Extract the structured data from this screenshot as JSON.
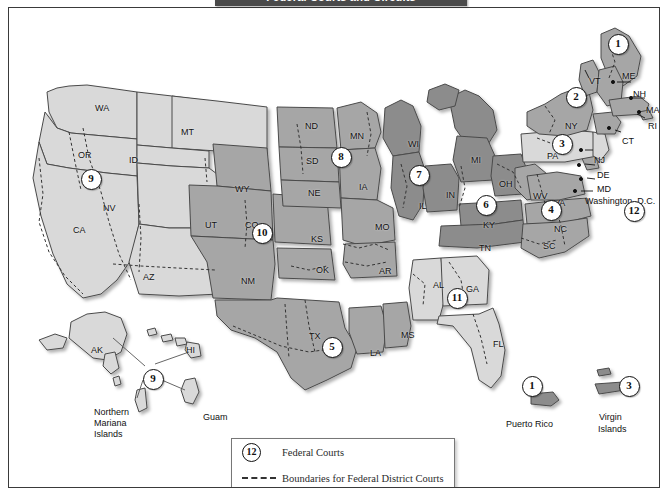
{
  "title": "Federal Courts and Circuits",
  "legend": {
    "courts_symbol": "12",
    "courts_label": "Federal Courts",
    "boundaries_label": "Boundaries for Federal District Courts"
  },
  "circuits": [
    {
      "id": "1",
      "x": 608,
      "y": 35,
      "name": "circuit-1"
    },
    {
      "id": "2",
      "x": 566,
      "y": 88,
      "name": "circuit-2"
    },
    {
      "id": "3",
      "x": 552,
      "y": 135,
      "name": "circuit-3"
    },
    {
      "id": "4",
      "x": 541,
      "y": 201,
      "name": "circuit-4"
    },
    {
      "id": "5",
      "x": 322,
      "y": 338,
      "name": "circuit-5"
    },
    {
      "id": "6",
      "x": 476,
      "y": 196,
      "name": "circuit-6"
    },
    {
      "id": "7",
      "x": 409,
      "y": 166,
      "name": "circuit-7"
    },
    {
      "id": "8",
      "x": 331,
      "y": 148,
      "name": "circuit-8"
    },
    {
      "id": "9",
      "x": 81,
      "y": 170,
      "name": "circuit-9-mainland"
    },
    {
      "id": "10",
      "x": 252,
      "y": 224,
      "name": "circuit-10"
    },
    {
      "id": "11",
      "x": 447,
      "y": 289,
      "name": "circuit-11"
    },
    {
      "id": "12",
      "x": 624,
      "y": 202,
      "name": "circuit-12-dc"
    },
    {
      "id": "9",
      "x": 143,
      "y": 370,
      "name": "circuit-9-pacific"
    },
    {
      "id": "1",
      "x": 522,
      "y": 377,
      "name": "circuit-1-puerto-rico"
    },
    {
      "id": "3",
      "x": 619,
      "y": 377,
      "name": "circuit-3-virgin-islands"
    }
  ],
  "state_labels": [
    {
      "t": "WA",
      "x": 86,
      "y": 95
    },
    {
      "t": "OR",
      "x": 69,
      "y": 142
    },
    {
      "t": "ID",
      "x": 120,
      "y": 147
    },
    {
      "t": "MT",
      "x": 172,
      "y": 119
    },
    {
      "t": "NV",
      "x": 94,
      "y": 195
    },
    {
      "t": "CA",
      "x": 64,
      "y": 217
    },
    {
      "t": "AZ",
      "x": 134,
      "y": 264
    },
    {
      "t": "UT",
      "x": 196,
      "y": 212
    },
    {
      "t": "CO",
      "x": 236,
      "y": 212
    },
    {
      "t": "WY",
      "x": 226,
      "y": 176
    },
    {
      "t": "NM",
      "x": 232,
      "y": 268
    },
    {
      "t": "ND",
      "x": 296,
      "y": 113
    },
    {
      "t": "SD",
      "x": 297,
      "y": 148
    },
    {
      "t": "NE",
      "x": 299,
      "y": 180
    },
    {
      "t": "KS",
      "x": 302,
      "y": 226
    },
    {
      "t": "OK",
      "x": 307,
      "y": 257
    },
    {
      "t": "TX",
      "x": 300,
      "y": 323
    },
    {
      "t": "MN",
      "x": 341,
      "y": 123
    },
    {
      "t": "IA",
      "x": 350,
      "y": 174
    },
    {
      "t": "MO",
      "x": 366,
      "y": 214
    },
    {
      "t": "AR",
      "x": 370,
      "y": 258
    },
    {
      "t": "LA",
      "x": 361,
      "y": 340
    },
    {
      "t": "MS",
      "x": 392,
      "y": 322
    },
    {
      "t": "AL",
      "x": 424,
      "y": 272
    },
    {
      "t": "GA",
      "x": 457,
      "y": 276
    },
    {
      "t": "FL",
      "x": 484,
      "y": 331
    },
    {
      "t": "WI",
      "x": 399,
      "y": 131
    },
    {
      "t": "IL",
      "x": 410,
      "y": 193
    },
    {
      "t": "IN",
      "x": 437,
      "y": 182
    },
    {
      "t": "MI",
      "x": 462,
      "y": 147
    },
    {
      "t": "OH",
      "x": 490,
      "y": 171
    },
    {
      "t": "KY",
      "x": 474,
      "y": 212
    },
    {
      "t": "TN",
      "x": 470,
      "y": 235
    },
    {
      "t": "WV",
      "x": 524,
      "y": 183
    },
    {
      "t": "VA",
      "x": 545,
      "y": 190
    },
    {
      "t": "NC",
      "x": 545,
      "y": 216
    },
    {
      "t": "SC",
      "x": 534,
      "y": 233
    },
    {
      "t": "PA",
      "x": 538,
      "y": 143
    },
    {
      "t": "NY",
      "x": 556,
      "y": 113
    },
    {
      "t": "VT",
      "x": 580,
      "y": 68
    },
    {
      "t": "NH",
      "x": 624,
      "y": 81
    },
    {
      "t": "ME",
      "x": 613,
      "y": 63
    },
    {
      "t": "MA",
      "x": 637,
      "y": 97
    },
    {
      "t": "RI",
      "x": 639,
      "y": 113
    },
    {
      "t": "CT",
      "x": 613,
      "y": 128
    },
    {
      "t": "NJ",
      "x": 585,
      "y": 147
    },
    {
      "t": "DE",
      "x": 588,
      "y": 162
    },
    {
      "t": "MD",
      "x": 588,
      "y": 176
    },
    {
      "t": "AK",
      "x": 82,
      "y": 337
    },
    {
      "t": "HI",
      "x": 177,
      "y": 337
    }
  ],
  "place_labels": [
    {
      "t": "Washington, D.C.",
      "x": 576,
      "y": 188,
      "name": "label-washington-dc"
    },
    {
      "t": "Guam",
      "x": 194,
      "y": 404,
      "name": "label-guam"
    },
    {
      "t": "Puerto Rico",
      "x": 497,
      "y": 411,
      "name": "label-puerto-rico"
    },
    {
      "t": "Virgin",
      "x": 590,
      "y": 404,
      "name": "label-virgin"
    },
    {
      "t": "Islands",
      "x": 589,
      "y": 416,
      "name": "label-virgin-islands"
    }
  ],
  "multiline_labels": [
    {
      "t": "Northern Mariana Islands",
      "x": 85,
      "y": 399,
      "name": "label-northern-mariana-islands"
    }
  ],
  "colors": {
    "circuit_light": "#d6d6d6",
    "circuit_mid": "#a8a8a8",
    "circuit_dark": "#8a8a8a",
    "outline": "#4a4a4a",
    "district_boundary": "#333333",
    "banner": "#4a4a4a",
    "frame": "#3a3a3a"
  }
}
